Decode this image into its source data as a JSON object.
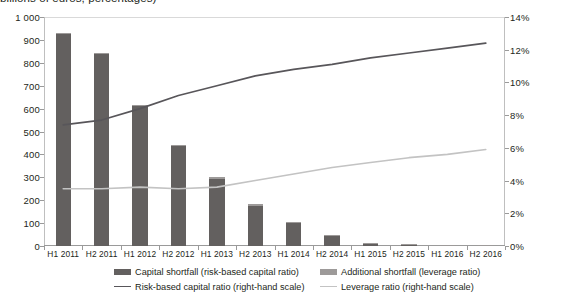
{
  "chart_data": {
    "type": "bar",
    "title": "billions of euros, percentages)",
    "xlabel": "",
    "ylabel": "",
    "ylabel_right": "",
    "grid": false,
    "legend_position": "bottom",
    "categories": [
      "H1 2011",
      "H2 2011",
      "H1 2012",
      "H2 2012",
      "H1 2013",
      "H2 2013",
      "H1 2014",
      "H2 2014",
      "H1 2015",
      "H2 2015",
      "H1 2016",
      "H2 2016"
    ],
    "ylim": [
      0,
      1000
    ],
    "yticks": [
      "0",
      "100",
      "200",
      "300",
      "400",
      "500",
      "600",
      "700",
      "800",
      "900",
      "1 000"
    ],
    "ytick_values": [
      0,
      100,
      200,
      300,
      400,
      500,
      600,
      700,
      800,
      900,
      1000
    ],
    "ylim_right": [
      0,
      14
    ],
    "yticks_right": [
      "0%",
      "2%",
      "4%",
      "6%",
      "8%",
      "10%",
      "12%",
      "14%"
    ],
    "ytick_values_right": [
      0,
      2,
      4,
      6,
      8,
      10,
      12,
      14
    ],
    "series": [
      {
        "name": "Capital shortfall (risk-based capital ratio)",
        "type": "bar",
        "axis": "left",
        "color": "#63605f",
        "values": [
          925,
          838,
          612,
          438,
          292,
          176,
          102,
          44,
          14,
          9,
          4,
          3
        ]
      },
      {
        "name": "Additional shortfall (leverage ratio)",
        "type": "bar",
        "axis": "left",
        "color": "#9d9a99",
        "values": [
          6,
          4,
          4,
          4,
          8,
          6,
          3,
          2,
          1,
          1,
          1,
          1
        ]
      },
      {
        "name": "Risk-based capital ratio (right-hand scale)",
        "type": "line",
        "axis": "right",
        "color": "#58565a",
        "values": [
          7.4,
          7.7,
          8.4,
          9.2,
          9.8,
          10.4,
          10.8,
          11.1,
          11.5,
          11.8,
          12.1,
          12.4
        ]
      },
      {
        "name": "Leverage ratio (right-hand scale)",
        "type": "line",
        "axis": "right",
        "color": "#c3c3c3",
        "values": [
          3.5,
          3.5,
          3.6,
          3.5,
          3.6,
          4.0,
          4.4,
          4.8,
          5.1,
          5.4,
          5.6,
          5.9
        ]
      }
    ]
  },
  "legend": {
    "items": [
      {
        "label": "Capital shortfall (risk-based capital ratio)",
        "marker": "box",
        "color": "#63605f"
      },
      {
        "label": "Additional shortfall (leverage ratio)",
        "marker": "box",
        "color": "#9d9a99"
      },
      {
        "label": "Risk-based capital ratio (right-hand scale)",
        "marker": "line",
        "color": "#58565a"
      },
      {
        "label": "Leverage ratio (right-hand scale)",
        "marker": "line",
        "color": "#c3c3c3"
      }
    ]
  },
  "colors": {
    "bar_primary": "#63605f",
    "bar_secondary": "#9d9a99",
    "line_primary": "#58565a",
    "line_secondary": "#c3c3c3",
    "axis": "#9a9a9a",
    "text": "#231f20"
  }
}
